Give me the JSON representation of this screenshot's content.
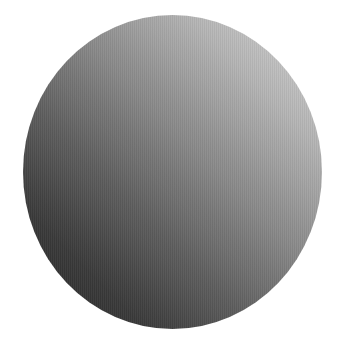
{
  "image": {
    "subject": "gradient-shaded sphere",
    "background_color": "#ffffff",
    "sphere": {
      "light_color": "#d6d6d6",
      "mid_color": "#8a8a8a",
      "dark_color": "#262626",
      "light_direction": "top-right"
    }
  }
}
